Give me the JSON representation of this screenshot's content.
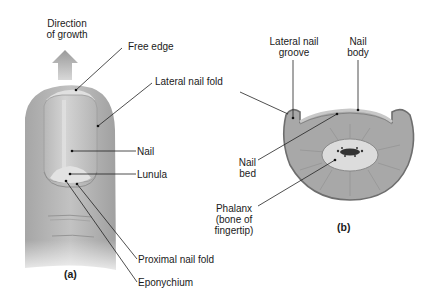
{
  "figure": {
    "panel_a": {
      "panel_label": "(a)",
      "labels": {
        "direction_line1": "Direction",
        "direction_line2": "of growth",
        "free_edge": "Free edge",
        "lateral_nail_fold": "Lateral nail fold",
        "nail": "Nail",
        "lunula": "Lunula",
        "proximal_nail_fold": "Proximal nail fold",
        "eponychium": "Eponychium"
      }
    },
    "panel_b": {
      "panel_label": "(b)",
      "labels": {
        "lateral_nail_groove_line1": "Lateral nail",
        "lateral_nail_groove_line2": "groove",
        "nail_body_line1": "Nail",
        "nail_body_line2": "body",
        "nail_bed_line1": "Nail",
        "nail_bed_line2": "bed",
        "phalanx_line1": "Phalanx",
        "phalanx_line2": "(bone of",
        "phalanx_line3": "fingertip)"
      }
    },
    "colors": {
      "skin": "#b4b4b4",
      "nail": "#c8c8c8",
      "lunula": "#dedede",
      "tissue": "#a9a9a9",
      "bone": "#dcdcdc",
      "leader_line": "#222222"
    }
  }
}
